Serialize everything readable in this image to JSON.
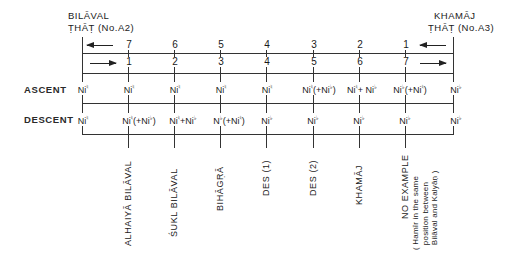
{
  "left_that": {
    "line1": "BILĀVAL",
    "line2": "ṬHĀṬ (No.A2)"
  },
  "right_that": {
    "line1": "KHAMĀJ",
    "line2": "ṬHĀṬ (No.A3)"
  },
  "top_numbers": [
    "7",
    "6",
    "5",
    "4",
    "3",
    "2",
    "1"
  ],
  "bottom_numbers": [
    "1",
    "2",
    "3",
    "4",
    "5",
    "6",
    "7"
  ],
  "row_labels": {
    "ascent": "ASCENT",
    "descent": "DESCENT"
  },
  "symbols": {
    "natural": "♮",
    "flat": "♭"
  },
  "ascent": [
    {
      "base": "Ni",
      "acc": "♮",
      "extra": ""
    },
    {
      "base": "Ni",
      "acc": "♮",
      "extra": ""
    },
    {
      "base": "Ni",
      "acc": "♮",
      "extra": ""
    },
    {
      "base": "Ni",
      "acc": "♮",
      "extra": ""
    },
    {
      "base": "Ni",
      "acc": "♮",
      "extra": ""
    },
    {
      "base": "Ni",
      "acc": "♮",
      "extra": "(+Ni",
      "extra_acc": "♭",
      "extra_close": ")"
    },
    {
      "base": "Ni",
      "acc": "♮",
      "extra": "+ Ni",
      "extra_acc": "♭",
      "extra_close": ""
    },
    {
      "base": "Ni",
      "acc": "♭",
      "extra": "(+Ni",
      "extra_acc": "♮",
      "extra_close": ")"
    },
    {
      "base": "Ni",
      "acc": "♭",
      "extra": ""
    }
  ],
  "descent": [
    {
      "base": "Ni",
      "acc": "♮",
      "extra": ""
    },
    {
      "base": "Ni",
      "acc": "♮",
      "extra": "(+Ni",
      "extra_acc": "♭",
      "extra_close": ")"
    },
    {
      "base": "Ni",
      "acc": "♮",
      "extra": "+Ni",
      "extra_acc": "♭",
      "extra_close": ""
    },
    {
      "base": "N",
      "acc": "♭",
      "extra": "(+Ni",
      "extra_acc": "♮",
      "extra_close": ")"
    },
    {
      "base": "Ni",
      "acc": "♭",
      "extra": ""
    },
    {
      "base": "Ni",
      "acc": "♭",
      "extra": ""
    },
    {
      "base": "Ni",
      "acc": "♭",
      "extra": ""
    },
    {
      "base": "Ni",
      "acc": "♭",
      "extra": ""
    },
    {
      "base": "Ni",
      "acc": "♭",
      "extra": ""
    }
  ],
  "raga_labels": [
    "ALHAIYĀ  BILĀVAL",
    "ŚUKL  BILĀVAL",
    "BIHĀGṚĀ",
    "DES (1)",
    "DES (2)",
    "KHAMĀJ",
    "NO EXAMPLE"
  ],
  "note_label": "( Hamīr in the same\n  position between\n  Bilāval and Kalyāṇ )"
}
